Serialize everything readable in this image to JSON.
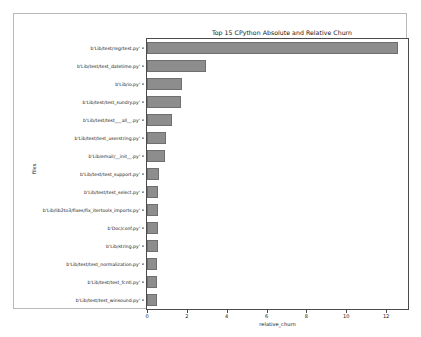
{
  "figure": {
    "caption_faint": ""
  },
  "chart_data": {
    "type": "bar",
    "orientation": "horizontal",
    "title": "Top 15 CPython Absolute and Relative Churn",
    "xlabel": "relative_churn",
    "ylabel": "files",
    "xlim": [
      0,
      13.1
    ],
    "xticks": [
      0,
      2,
      4,
      6,
      8,
      10,
      12
    ],
    "xtick_labels": [
      "0",
      "2",
      "4",
      "6",
      "8",
      "10",
      "12"
    ],
    "grid": false,
    "legend": null,
    "bar_color": "#8d8d8d",
    "bar_edge_color": "#6f6f6f",
    "categories": [
      "b'Lib/test/regrtest.py'",
      "b'Lib/test/test_datetime.py'",
      "b'Lib/io.py'",
      "b'Lib/test/test_sundry.py'",
      "b'Lib/test/test___all__.py'",
      "b'Lib/test/test_userstring.py'",
      "b'Lib/email/__init__.py'",
      "b'Lib/test/test_support.py'",
      "b'Lib/test/test_select.py'",
      "b'Lib/lib2to3/fixes/fix_itertools_imports.py'",
      "b'Doc/conf.py'",
      "b'Lib/string.py'",
      "b'Lib/test/test_normalization.py'",
      "b'Lib/test/test_fcntl.py'",
      "b'Lib/test/test_winsound.py'"
    ],
    "values": [
      12.6,
      2.95,
      1.75,
      1.72,
      1.25,
      0.95,
      0.88,
      0.58,
      0.56,
      0.55,
      0.54,
      0.53,
      0.52,
      0.5,
      0.48
    ]
  }
}
